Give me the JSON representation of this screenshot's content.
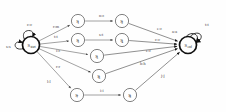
{
  "figure": {
    "type": "state-transition-diagram",
    "background": "#ffffff",
    "stroke_color": "#4a4a4a",
    "bold_stroke_color": "#111111",
    "label_color": "#3a3a3a"
  },
  "states": [
    {
      "id": "start",
      "label": "S",
      "sub": "start",
      "cx": 31,
      "cy": 45,
      "r": 8.5,
      "bold": true,
      "accepting": false,
      "name": "state-s-start"
    },
    {
      "id": "s1",
      "label": "S",
      "sub": "1",
      "cx": 78,
      "cy": 21,
      "r": 6.6,
      "bold": false,
      "accepting": false,
      "name": "state-s1"
    },
    {
      "id": "s2",
      "label": "S",
      "sub": "2",
      "cx": 122,
      "cy": 21,
      "r": 6.6,
      "bold": false,
      "accepting": false,
      "name": "state-s2"
    },
    {
      "id": "s3",
      "label": "S",
      "sub": "3",
      "cx": 78,
      "cy": 40,
      "r": 6.6,
      "bold": false,
      "accepting": false,
      "name": "state-s3"
    },
    {
      "id": "s4",
      "label": "S",
      "sub": "4",
      "cx": 122,
      "cy": 40,
      "r": 6.6,
      "bold": false,
      "accepting": false,
      "name": "state-s4"
    },
    {
      "id": "s5",
      "label": "S",
      "sub": "5",
      "cx": 97,
      "cy": 56,
      "r": 6.6,
      "bold": false,
      "accepting": false,
      "name": "state-s5"
    },
    {
      "id": "s6",
      "label": "S",
      "sub": "6",
      "cx": 99,
      "cy": 76,
      "r": 6.6,
      "bold": false,
      "accepting": false,
      "name": "state-s6"
    },
    {
      "id": "s7",
      "label": "S",
      "sub": "7",
      "cx": 77,
      "cy": 95,
      "r": 6.6,
      "bold": false,
      "accepting": false,
      "name": "state-s7"
    },
    {
      "id": "s8",
      "label": "S",
      "sub": "8",
      "cx": 130,
      "cy": 95,
      "r": 6.6,
      "bold": false,
      "accepting": false,
      "name": "state-s8"
    },
    {
      "id": "end",
      "label": "S",
      "sub": "end",
      "cx": 188,
      "cy": 45,
      "r": 8.5,
      "bold": true,
      "accepting": true,
      "name": "state-s-end"
    }
  ],
  "self_loops": [
    {
      "id": "loop-start-top",
      "on": "start",
      "label": "c:c",
      "lx": 27,
      "ly": 26,
      "name": "self-loop-start-top"
    },
    {
      "id": "loop-start-bottom",
      "on": "start",
      "label": "s:s",
      "lx": 6,
      "ly": 48,
      "name": "self-loop-start-bottom"
    },
    {
      "id": "loop-end-top",
      "on": "end",
      "label": "t:t",
      "lx": 205,
      "ly": 26,
      "name": "self-loop-end-top"
    },
    {
      "id": "loop-end-left",
      "on": "end",
      "label": "a:a",
      "lx": 172,
      "ly": 33,
      "name": "self-loop-end-left"
    }
  ],
  "edges": [
    {
      "id": "e1",
      "from": "start",
      "to": "s1",
      "label": "r:m",
      "lx": 53,
      "ly": 28,
      "name": "edge-start-s1"
    },
    {
      "id": "e2",
      "from": "s1",
      "to": "s2",
      "label": "n:ε",
      "lx": 99,
      "ly": 17,
      "name": "edge-s1-s2"
    },
    {
      "id": "e3",
      "from": "s2",
      "to": "end",
      "label": "e:ε",
      "lx": 157,
      "ly": 30,
      "name": "edge-s2-end"
    },
    {
      "id": "e4",
      "from": "start",
      "to": "s3",
      "label": "t:t",
      "lx": 54,
      "ly": 38,
      "name": "edge-start-s3"
    },
    {
      "id": "e5",
      "from": "s3",
      "to": "s4",
      "label": "s:t",
      "lx": 99,
      "ly": 36,
      "name": "edge-s3-s4"
    },
    {
      "id": "e6",
      "from": "s4",
      "to": "end",
      "label": "c:c",
      "lx": 155,
      "ly": 41,
      "name": "edge-s4-end"
    },
    {
      "id": "e7",
      "from": "start",
      "to": "s5",
      "label": "i:ε",
      "lx": 56,
      "ly": 52,
      "name": "edge-start-s5"
    },
    {
      "id": "e8",
      "from": "s5",
      "to": "end",
      "label": "e:ε",
      "lx": 146,
      "ly": 52,
      "name": "edge-s5-end"
    },
    {
      "id": "e9",
      "from": "start",
      "to": "s6",
      "label": "r:r",
      "lx": 56,
      "ly": 68,
      "name": "edge-start-s6"
    },
    {
      "id": "e10",
      "from": "s6",
      "to": "end",
      "label": "h:h",
      "lx": 140,
      "ly": 65,
      "name": "edge-s6-end"
    },
    {
      "id": "e11",
      "from": "start",
      "to": "s7",
      "label": "l:l",
      "lx": 47,
      "ly": 83,
      "name": "edge-start-s7"
    },
    {
      "id": "e12",
      "from": "s7",
      "to": "s8",
      "label": "i:i",
      "lx": 100,
      "ly": 92,
      "name": "edge-s7-s8"
    },
    {
      "id": "e13",
      "from": "s8",
      "to": "end",
      "label": "j:j",
      "lx": 161,
      "ly": 77,
      "name": "edge-s8-end"
    }
  ]
}
